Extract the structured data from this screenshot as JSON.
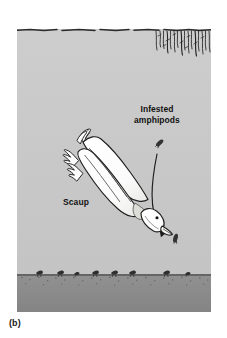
{
  "figure": {
    "caption": "(b)",
    "panel_label": "(b)"
  },
  "labels": {
    "infested_amphipods": "Infested\namphipods",
    "infested_amphipods_line1": "Infested",
    "infested_amphipods_line2": "amphipods",
    "scaup": "Scaup"
  },
  "colors": {
    "water": "#c9c9c9",
    "water_light": "#cfcfcf",
    "sediment": "#8f8f8f",
    "sediment_dark": "#7e7e7e",
    "ink": "#1a1a1a",
    "bird_body": "#fdfdfd",
    "bird_belly": "#e3e3e0",
    "page": "#ffffff",
    "amphipod": "#3a3a3a"
  },
  "scene": {
    "water_surface_y": 8,
    "sediment_top_y": 252,
    "panel_width": 194,
    "panel_height": 290,
    "elements": [
      {
        "name": "water-surface-line",
        "kind": "wavy-line"
      },
      {
        "name": "surface-vegetation",
        "kind": "hanging-reeds",
        "side": "top-right"
      },
      {
        "name": "scaup-bird",
        "kind": "diving-duck",
        "heading": "down-right"
      },
      {
        "name": "feeding-arrow",
        "kind": "curved-arrow",
        "from": "drifting-amphipod",
        "to": "scaup-bill"
      },
      {
        "name": "drifting-amphipod-upper",
        "kind": "amphipod"
      },
      {
        "name": "drifting-amphipod-lower",
        "kind": "amphipod"
      },
      {
        "name": "sediment-bed",
        "kind": "substrate"
      },
      {
        "name": "benthic-amphipods",
        "kind": "amphipod-cluster",
        "count": 8
      }
    ]
  }
}
